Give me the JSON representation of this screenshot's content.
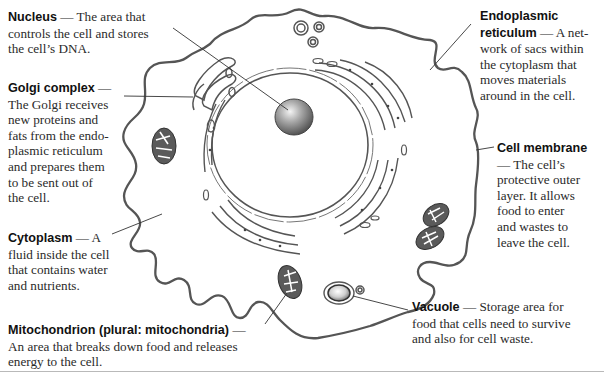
{
  "diagram": {
    "colors": {
      "outline": "#4a4a4a",
      "shading": "#8a8a8a",
      "text": "#2a2a2a",
      "rule": "#b9b9b9"
    }
  },
  "labels": {
    "nucleus": {
      "term": "Nucleus",
      "dash": " — ",
      "desc": "The area that\ncontrols the cell and stores\nthe cell’s DNA."
    },
    "golgi": {
      "term": "Golgi complex",
      "dash": " —",
      "desc": "The Golgi receives\nnew proteins and\nfats from the endo-\nplasmic reticulum\nand prepares them\nto be sent out of\nthe cell."
    },
    "cytoplasm": {
      "term": "Cytoplasm",
      "dash": " — ",
      "desc": "A\nfluid inside the cell\nthat contains water\nand nutrients."
    },
    "mitochondrion": {
      "term": "Mitochondrion (plural: mitochondria)",
      "dash": " —",
      "desc": "An area that breaks down food and releases\nenergy to the cell."
    },
    "er": {
      "term_line1": "Endoplasmic",
      "term_line2": "reticulum",
      "dash": " — ",
      "desc": "A net-\nwork of sacs within\nthe cytoplasm that\nmoves materials\naround in the cell."
    },
    "membrane": {
      "term": "Cell membrane",
      "desc": "— The cell’s\nprotective outer\nlayer. It allows\nfood to enter\nand wastes to\nleave the cell."
    },
    "vacuole": {
      "term": "Vacuole",
      "dash": " — ",
      "desc": "Storage area for\nfood that cells need to survive\nand also for cell waste."
    }
  }
}
